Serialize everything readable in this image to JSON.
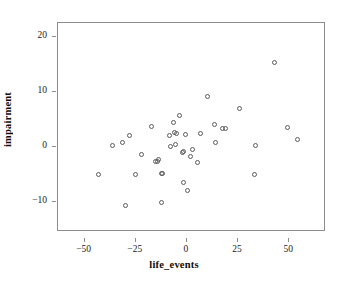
{
  "chart_data": {
    "type": "scatter",
    "title": "",
    "xlabel": "life_events",
    "ylabel": "impairment",
    "xlim": [
      -63,
      68
    ],
    "ylim": [
      -15.5,
      22.5
    ],
    "grid": false,
    "legend": null,
    "xticks": [
      -50,
      -25,
      0,
      25,
      50
    ],
    "xticklabels": [
      "−50",
      "−25",
      "0",
      "25",
      "50"
    ],
    "yticks": [
      -10,
      0,
      10,
      20
    ],
    "yticklabels": [
      "−10",
      "0",
      "10",
      "20"
    ],
    "marker": "open-circle",
    "marker_color": "#5a5a5a",
    "n_points": 49,
    "points": [
      {
        "x": -43.0,
        "y": -5.0
      },
      {
        "x": -36.5,
        "y": 0.3
      },
      {
        "x": -31.5,
        "y": 0.7
      },
      {
        "x": -30.0,
        "y": -10.7
      },
      {
        "x": -28.0,
        "y": 2.0
      },
      {
        "x": -25.0,
        "y": -5.0
      },
      {
        "x": -22.0,
        "y": -1.4
      },
      {
        "x": -17.5,
        "y": 3.6
      },
      {
        "x": -15.5,
        "y": -2.6
      },
      {
        "x": -14.5,
        "y": -2.6
      },
      {
        "x": -14.0,
        "y": -2.4
      },
      {
        "x": -12.5,
        "y": -4.8
      },
      {
        "x": -12.0,
        "y": -4.9
      },
      {
        "x": -12.5,
        "y": -10.1
      },
      {
        "x": -8.5,
        "y": 2.1
      },
      {
        "x": -8.0,
        "y": 0.0
      },
      {
        "x": -6.5,
        "y": 4.4
      },
      {
        "x": -6.0,
        "y": 2.6
      },
      {
        "x": -5.5,
        "y": 0.5
      },
      {
        "x": -5.0,
        "y": 2.4
      },
      {
        "x": -3.5,
        "y": 5.6
      },
      {
        "x": -2.0,
        "y": -1.0
      },
      {
        "x": -1.5,
        "y": -0.8
      },
      {
        "x": -0.5,
        "y": 2.3
      },
      {
        "x": 0.5,
        "y": -8.0
      },
      {
        "x": -1.5,
        "y": -6.5
      },
      {
        "x": 2.5,
        "y": -0.5
      },
      {
        "x": 2.0,
        "y": -1.8
      },
      {
        "x": 5.0,
        "y": -2.8
      },
      {
        "x": 6.5,
        "y": 2.4
      },
      {
        "x": 10.0,
        "y": 9.1
      },
      {
        "x": 13.5,
        "y": 4.0
      },
      {
        "x": 14.0,
        "y": 0.8
      },
      {
        "x": 17.5,
        "y": 3.3
      },
      {
        "x": 19.0,
        "y": 3.4
      },
      {
        "x": 25.5,
        "y": 6.9
      },
      {
        "x": 33.5,
        "y": 0.3
      },
      {
        "x": 33.0,
        "y": -5.1
      },
      {
        "x": 43.0,
        "y": 15.4
      },
      {
        "x": 49.0,
        "y": 3.5
      },
      {
        "x": 54.0,
        "y": 1.4
      }
    ]
  }
}
